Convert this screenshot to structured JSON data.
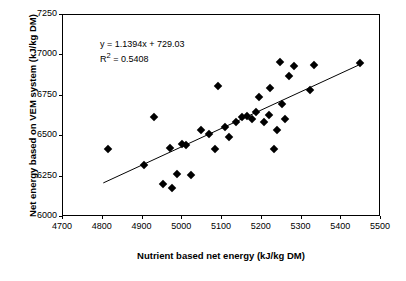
{
  "chart_data": {
    "type": "scatter",
    "title": "",
    "xlabel": "Nutrient based net energy (kJ/kg DM)",
    "ylabel": "Net energy based on VEM system (kJ/kg DM)",
    "xlim": [
      4700,
      5500
    ],
    "ylim": [
      6000,
      7250
    ],
    "xticks": [
      4700,
      4800,
      4900,
      5000,
      5100,
      5200,
      5300,
      5400,
      5500
    ],
    "yticks": [
      6000,
      6250,
      6500,
      6750,
      7000,
      7250
    ],
    "grid": false,
    "legend": null,
    "annotations": {
      "equation": "y = 1.1394x + 729.03",
      "r_squared": "R2 = 0.5408",
      "r_squared_display": "R",
      "r_squared_sup": "2",
      "r_squared_rest": " = 0.5408"
    },
    "trendline": {
      "slope": 1.1394,
      "intercept": 729.03,
      "x_start": 4802,
      "x_end": 5448
    },
    "points": [
      {
        "x": 4812,
        "y": 6418
      },
      {
        "x": 4905,
        "y": 6322
      },
      {
        "x": 4930,
        "y": 6618
      },
      {
        "x": 4952,
        "y": 6206
      },
      {
        "x": 4968,
        "y": 6428
      },
      {
        "x": 4975,
        "y": 6180
      },
      {
        "x": 4988,
        "y": 6268
      },
      {
        "x": 5000,
        "y": 6452
      },
      {
        "x": 5010,
        "y": 6448
      },
      {
        "x": 5022,
        "y": 6262
      },
      {
        "x": 5048,
        "y": 6540
      },
      {
        "x": 5068,
        "y": 6512
      },
      {
        "x": 5082,
        "y": 6418
      },
      {
        "x": 5090,
        "y": 6812
      },
      {
        "x": 5108,
        "y": 6560
      },
      {
        "x": 5118,
        "y": 6492
      },
      {
        "x": 5135,
        "y": 6585
      },
      {
        "x": 5150,
        "y": 6618
      },
      {
        "x": 5162,
        "y": 6625
      },
      {
        "x": 5175,
        "y": 6608
      },
      {
        "x": 5185,
        "y": 6648
      },
      {
        "x": 5192,
        "y": 6742
      },
      {
        "x": 5205,
        "y": 6588
      },
      {
        "x": 5218,
        "y": 6632
      },
      {
        "x": 5222,
        "y": 6798
      },
      {
        "x": 5232,
        "y": 6418
      },
      {
        "x": 5238,
        "y": 6538
      },
      {
        "x": 5245,
        "y": 6962
      },
      {
        "x": 5252,
        "y": 6698
      },
      {
        "x": 5258,
        "y": 6608
      },
      {
        "x": 5268,
        "y": 6872
      },
      {
        "x": 5282,
        "y": 6932
      },
      {
        "x": 5322,
        "y": 6788
      },
      {
        "x": 5332,
        "y": 6938
      },
      {
        "x": 5448,
        "y": 6952
      }
    ]
  }
}
